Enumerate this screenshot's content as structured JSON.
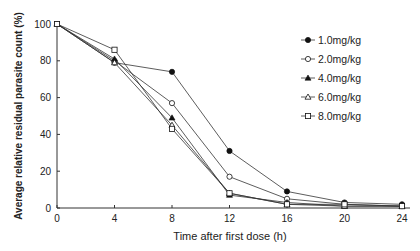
{
  "chart_data": {
    "type": "line",
    "title": "",
    "xlabel": "Time after first dose (h)",
    "ylabel": "Average relative residual parasite count (%)",
    "x": [
      0,
      4,
      8,
      12,
      16,
      20,
      24
    ],
    "xticks": [
      "0",
      "4",
      "8",
      "12",
      "16",
      "20",
      "24"
    ],
    "yticks": [
      "0",
      "20",
      "40",
      "60",
      "80",
      "100"
    ],
    "xlim": [
      0,
      24
    ],
    "ylim": [
      0,
      100
    ],
    "grid": false,
    "legend_position": "upper right",
    "series": [
      {
        "name": "1.0mg/kg",
        "marker": "filled-circle",
        "values": [
          100,
          79,
          74,
          31,
          9,
          3,
          2
        ]
      },
      {
        "name": "2.0mg/kg",
        "marker": "open-circle",
        "values": [
          100,
          80,
          57,
          17,
          5,
          2,
          1
        ]
      },
      {
        "name": "4.0mg/kg",
        "marker": "filled-triangle",
        "values": [
          100,
          81,
          49,
          7,
          3,
          1,
          1
        ]
      },
      {
        "name": "6.0mg/kg",
        "marker": "open-triangle",
        "values": [
          100,
          79,
          45,
          8,
          2,
          1,
          1
        ]
      },
      {
        "name": "8.0mg/kg",
        "marker": "open-square",
        "values": [
          100,
          86,
          43,
          8,
          2,
          2,
          1
        ]
      }
    ]
  }
}
